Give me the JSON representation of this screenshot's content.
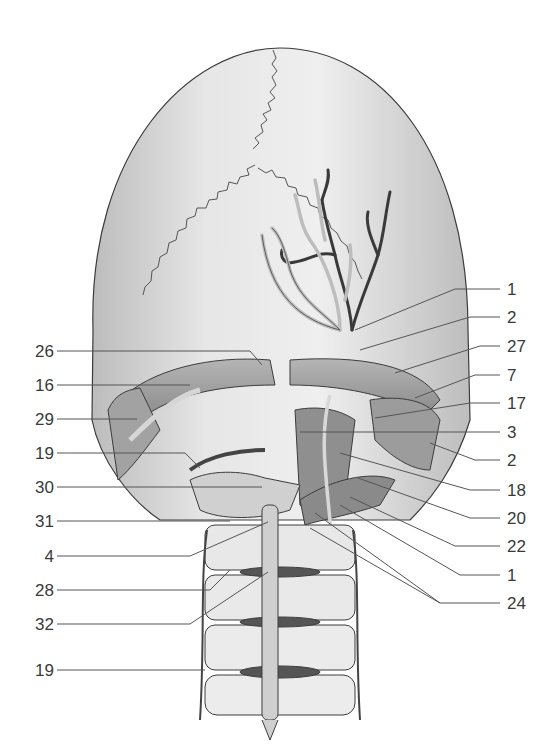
{
  "figure": {
    "colors": {
      "background": "#ffffff",
      "bone": "#e8e8e8",
      "bone_shade": "#bdbdbd",
      "outline": "#3c3c3c",
      "muscle": "#9a9a9a",
      "vessel_dark": "#3a3a3a",
      "vessel_light": "#d0d0d0",
      "leader_line": "#555555",
      "label_text": "#3a3a3a"
    },
    "left_labels": [
      {
        "text": "26",
        "y": 351
      },
      {
        "text": "16",
        "y": 385
      },
      {
        "text": "29",
        "y": 419
      },
      {
        "text": "19",
        "y": 453
      },
      {
        "text": "30",
        "y": 487
      },
      {
        "text": "31",
        "y": 521
      },
      {
        "text": "4",
        "y": 556
      },
      {
        "text": "28",
        "y": 590
      },
      {
        "text": "32",
        "y": 624
      },
      {
        "text": "19",
        "y": 670
      }
    ],
    "right_labels": [
      {
        "text": "1",
        "y": 289
      },
      {
        "text": "2",
        "y": 317
      },
      {
        "text": "27",
        "y": 346
      },
      {
        "text": "7",
        "y": 375
      },
      {
        "text": "17",
        "y": 403
      },
      {
        "text": "3",
        "y": 432
      },
      {
        "text": "2",
        "y": 460
      },
      {
        "text": "18",
        "y": 490
      },
      {
        "text": "20",
        "y": 518
      },
      {
        "text": "22",
        "y": 546
      },
      {
        "text": "1",
        "y": 575
      },
      {
        "text": "24",
        "y": 603
      }
    ]
  }
}
